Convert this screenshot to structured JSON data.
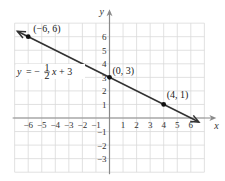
{
  "chart_data": {
    "type": "line",
    "title": "",
    "xlabel": "x",
    "ylabel": "y",
    "xlim": [
      -7,
      7
    ],
    "ylim": [
      -4,
      7
    ],
    "grid": true,
    "x_ticks": [
      -6,
      -5,
      -4,
      -3,
      -2,
      -1,
      1,
      2,
      3,
      4,
      5,
      6
    ],
    "y_ticks": [
      6,
      5,
      4,
      3,
      2,
      1,
      -1,
      -2,
      -3
    ],
    "x_tick_labels": [
      "−6",
      "−5",
      "−4",
      "−3",
      "−2",
      "−1",
      "1",
      "2",
      "3",
      "4",
      "5",
      "6"
    ],
    "y_tick_labels": [
      "6",
      "5",
      "4",
      "3",
      "2",
      "1",
      "−1",
      "−2",
      "−3"
    ],
    "series": [
      {
        "name": "y = -1/2 x + 3",
        "slope": -0.5,
        "intercept": 3,
        "x": [
          -6.8,
          6.6
        ],
        "y": [
          6.4,
          -0.3
        ],
        "arrows_both_ends": true
      }
    ],
    "points": [
      {
        "x": -6,
        "y": 6,
        "label": "(−6, 6)"
      },
      {
        "x": 0,
        "y": 3,
        "label": "(0, 3)"
      },
      {
        "x": 4,
        "y": 1,
        "label": "(4, 1)"
      }
    ],
    "annotations": [
      {
        "text": "y = −½x + 3",
        "equation": {
          "lhs": "y",
          "eq": "=",
          "sign": "−",
          "num": "1",
          "den": "2",
          "var": "x",
          "rest": "+ 3"
        }
      }
    ],
    "colors": {
      "grid": "#d9d9d9",
      "axis": "#8a8a8a",
      "line": "#333333",
      "point": "#111111"
    }
  }
}
